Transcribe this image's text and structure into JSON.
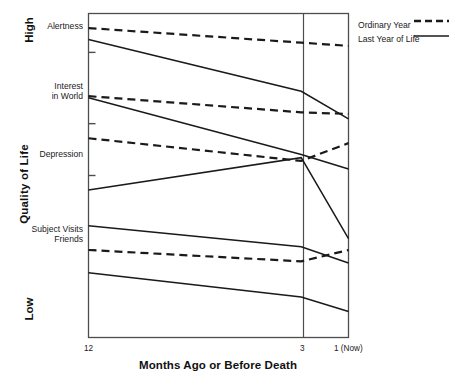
{
  "chart_data": {
    "type": "line",
    "title": "",
    "xlabel": "Months Ago or Before Death",
    "ylabel": "Quality of Life",
    "axis_extremes": {
      "high": "High",
      "low": "Low"
    },
    "x_ticks": [
      {
        "value": 12,
        "label": "12"
      },
      {
        "value": 3,
        "label": "3"
      },
      {
        "value": 1,
        "label": "1 (Now)"
      }
    ],
    "xlim": [
      12,
      1
    ],
    "x_reverse": true,
    "y_ticks": [
      {
        "label": "Alertness",
        "pos": 88
      },
      {
        "label": "Interest\nin World",
        "pos": 66
      },
      {
        "label": "Depression",
        "pos": 50
      },
      {
        "label": "Subject Visits\nFriends",
        "pos": 27
      }
    ],
    "ylim": [
      0,
      100
    ],
    "grid": false,
    "vertical_reference_line": {
      "at_x": 3,
      "label": "3"
    },
    "legend": {
      "position": "right-top",
      "entries": [
        {
          "name": "Ordinary Year",
          "style": "dashed"
        },
        {
          "name": "Last Year of Life",
          "style": "solid"
        }
      ]
    },
    "series": [
      {
        "name": "Alertness — Ordinary Year",
        "measure": "Alertness",
        "style": "dashed",
        "x": [
          12,
          3,
          1
        ],
        "y": [
          95.5,
          91.0,
          90.0
        ]
      },
      {
        "name": "Alertness — Last Year of Life",
        "measure": "Alertness",
        "style": "solid",
        "x": [
          12,
          3,
          1
        ],
        "y": [
          92.0,
          76.0,
          67.5
        ]
      },
      {
        "name": "Interest in World — Ordinary Year",
        "measure": "Interest in World",
        "style": "dashed",
        "x": [
          12,
          3,
          1
        ],
        "y": [
          74.5,
          69.5,
          69.0
        ]
      },
      {
        "name": "Interest in World — Last Year of Life",
        "measure": "Interest in World",
        "style": "solid",
        "x": [
          12,
          3,
          1
        ],
        "y": [
          74.0,
          56.5,
          52.0
        ]
      },
      {
        "name": "Depression — Ordinary Year",
        "measure": "Depression",
        "style": "dashed",
        "x": [
          12,
          3,
          1
        ],
        "y": [
          61.5,
          54.5,
          60.0
        ]
      },
      {
        "name": "Depression — Last Year of Life",
        "measure": "Depression",
        "style": "solid",
        "x": [
          12,
          3,
          1
        ],
        "y": [
          45.5,
          55.5,
          30.5
        ]
      },
      {
        "name": "Subject Visits Friends — Ordinary Year",
        "measure": "Subject Visits Friends",
        "style": "dashed",
        "x": [
          12,
          3,
          1
        ],
        "y": [
          27.0,
          23.5,
          27.0
        ]
      },
      {
        "name": "Subject Visits Friends — Last Year of Life",
        "measure": "Subject Visits Friends",
        "style": "solid",
        "x": [
          12,
          3,
          1
        ],
        "y": [
          34.5,
          28.0,
          23.0
        ]
      },
      {
        "name": "Bottom measure — Last Year of Life",
        "measure": "Bottom",
        "style": "solid",
        "x": [
          12,
          3,
          1
        ],
        "y": [
          20.0,
          12.5,
          8.0
        ]
      }
    ],
    "colors": {
      "line": "#1a1a1a",
      "axis": "#4d4d4d",
      "background": "#ffffff"
    }
  },
  "labels": {
    "y_axis_title": "Quality of Life",
    "high": "High",
    "low": "Low",
    "x_axis_title": "Months Ago or Before Death",
    "tick_alertness": "Alertness",
    "tick_interest": "Interest\nin World",
    "tick_depression": "Depression",
    "tick_visits": "Subject Visits\nFriends",
    "x_12": "12",
    "x_3": "3",
    "x_1": "1 (Now)",
    "legend_ordinary": "Ordinary Year",
    "legend_last": "Last Year of Life"
  }
}
